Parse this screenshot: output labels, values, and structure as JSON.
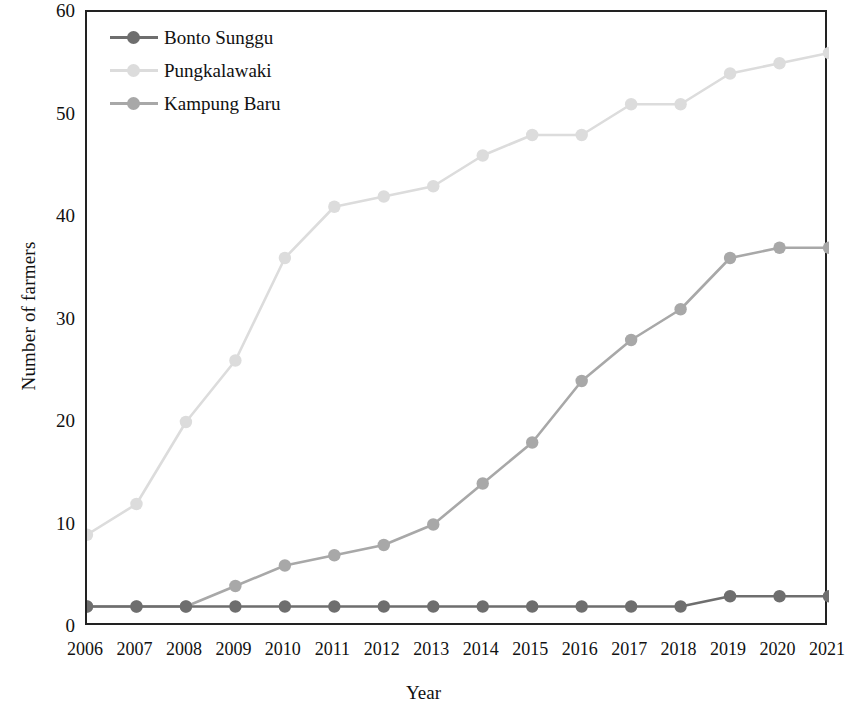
{
  "chart_data": {
    "type": "line",
    "title": "",
    "xlabel": "Year",
    "ylabel": "Number of farmers",
    "categories": [
      "2006",
      "2007",
      "2008",
      "2009",
      "2010",
      "2011",
      "2012",
      "2013",
      "2014",
      "2015",
      "2016",
      "2017",
      "2018",
      "2019",
      "2020",
      "2021"
    ],
    "x": [
      2006,
      2007,
      2008,
      2009,
      2010,
      2011,
      2012,
      2013,
      2014,
      2015,
      2016,
      2017,
      2018,
      2019,
      2020,
      2021
    ],
    "xlim": [
      2006,
      2021
    ],
    "ylim": [
      0,
      60
    ],
    "yticks": [
      0,
      10,
      20,
      30,
      40,
      50,
      60
    ],
    "grid": false,
    "legend_position": "top-left",
    "series": [
      {
        "name": "Bonto Sunggu",
        "color": "#6e6e6e",
        "values": [
          2,
          2,
          2,
          2,
          2,
          2,
          2,
          2,
          2,
          2,
          2,
          2,
          2,
          3,
          3,
          3
        ]
      },
      {
        "name": "Pungkalawaki",
        "color": "#dcdcdc",
        "values": [
          9,
          12,
          20,
          26,
          36,
          41,
          42,
          43,
          46,
          48,
          48,
          51,
          51,
          54,
          55,
          56
        ]
      },
      {
        "name": "Kampung Baru",
        "color": "#a8a8a8",
        "values": [
          2,
          2,
          2,
          4,
          6,
          7,
          8,
          10,
          14,
          18,
          24,
          28,
          31,
          36,
          37,
          37
        ]
      }
    ]
  },
  "axes": {
    "y_tick_labels": [
      "60",
      "50",
      "40",
      "30",
      "20",
      "10",
      "0"
    ],
    "x_tick_labels": [
      "2006",
      "2007",
      "2008",
      "2009",
      "2010",
      "2011",
      "2012",
      "2013",
      "2014",
      "2015",
      "2016",
      "2017",
      "2018",
      "2019",
      "2020",
      "2021"
    ],
    "y_title": "Number of farmers",
    "x_title": "Year"
  },
  "legend": {
    "items": [
      {
        "label": "Bonto Sunggu",
        "color": "#6e6e6e"
      },
      {
        "label": "Pungkalawaki",
        "color": "#dcdcdc"
      },
      {
        "label": "Kampung Baru",
        "color": "#a8a8a8"
      }
    ]
  },
  "colors": {
    "axis": "#222222",
    "text": "#111111",
    "background": "#ffffff"
  }
}
